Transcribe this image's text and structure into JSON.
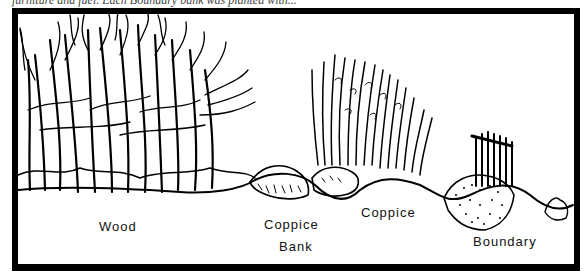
{
  "caption": {
    "text": "furniture and fuel. Each Boundary bank was planted with..."
  },
  "figure": {
    "labels": {
      "wood": "Wood",
      "coppice_bank_line1": "Coppice",
      "coppice_bank_line2": "Bank",
      "coppice": "Coppice",
      "boundary": "Boundary"
    },
    "colors": {
      "ink": "#000000",
      "paper": "#ffffff"
    }
  }
}
